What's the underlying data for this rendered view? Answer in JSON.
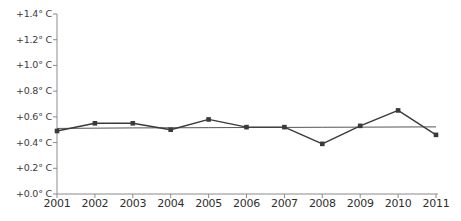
{
  "chart_data": {
    "type": "line",
    "title": "",
    "subtitle": "",
    "xlabel": "",
    "ylabel": "",
    "x": [
      2001,
      2002,
      2003,
      2004,
      2005,
      2006,
      2007,
      2008,
      2009,
      2010,
      2011
    ],
    "categories": [
      "2001",
      "2002",
      "2003",
      "2004",
      "2005",
      "2006",
      "2007",
      "2008",
      "2009",
      "2010",
      "2011"
    ],
    "series": [
      {
        "name": "Temperature anomaly",
        "values": [
          0.49,
          0.55,
          0.55,
          0.5,
          0.58,
          0.52,
          0.52,
          0.39,
          0.53,
          0.65,
          0.46
        ],
        "color": "#3a3a3a",
        "marker": "square"
      },
      {
        "name": "Trend line",
        "values": [
          0.51,
          0.512,
          0.514,
          0.515,
          0.516,
          0.517,
          0.518,
          0.519,
          0.52,
          0.521,
          0.522
        ],
        "color": "#555555",
        "marker": "none"
      }
    ],
    "ylim": [
      0.0,
      1.4
    ],
    "xlim": [
      2001,
      2011
    ],
    "ytick_values": [
      0.0,
      0.2,
      0.4,
      0.6,
      0.8,
      1.0,
      1.2,
      1.4
    ],
    "ytick_labels": [
      "+0.0° C",
      "+0.2° C",
      "+0.4° C",
      "+0.6° C",
      "+0.8° C",
      "+1.0° C",
      "+1.2° C",
      "+1.4° C"
    ],
    "xtick_labels": [
      "2001",
      "2002",
      "2003",
      "2004",
      "2005",
      "2006",
      "2007",
      "2008",
      "2009",
      "2010",
      "2011"
    ],
    "grid": false,
    "legend": "none",
    "annotations": []
  },
  "axes": {
    "axis_color": "#8a8a8a",
    "tick_color": "#8a8a8a",
    "label_color": "#3b3b3b",
    "background": "#ffffff"
  }
}
